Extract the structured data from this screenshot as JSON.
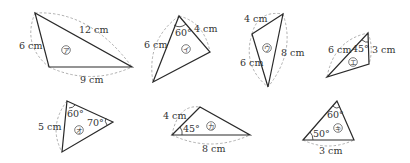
{
  "triangles": [
    {
      "id": "a",
      "mark": "ア",
      "labels": {
        "side1": "12 cm",
        "side2": "6 cm",
        "side3": "9 cm"
      }
    },
    {
      "id": "i",
      "mark": "イ",
      "labels": {
        "side1": "6 cm",
        "side2": "4 cm",
        "angle1": "60°"
      }
    },
    {
      "id": "u",
      "mark": "ウ",
      "labels": {
        "side1": "4 cm",
        "side2": "6 cm",
        "side3": "8 cm"
      }
    },
    {
      "id": "e",
      "mark": "エ",
      "labels": {
        "side1": "6 cm",
        "side2": "3 cm",
        "angle1": "45°"
      }
    },
    {
      "id": "o",
      "mark": "オ",
      "labels": {
        "side1": "5 cm",
        "angle1": "60°",
        "angle2": "70°"
      }
    },
    {
      "id": "ka",
      "mark": "カ",
      "labels": {
        "side1": "4 cm",
        "side2": "8 cm",
        "angle1": "45°"
      }
    },
    {
      "id": "ki",
      "mark": "キ",
      "labels": {
        "side1": "3 cm",
        "angle1": "60°",
        "angle2": "50°"
      }
    }
  ],
  "colors": {
    "edge": "#2a2a2a",
    "dash": "#9a9a9a",
    "text": "#333333"
  }
}
